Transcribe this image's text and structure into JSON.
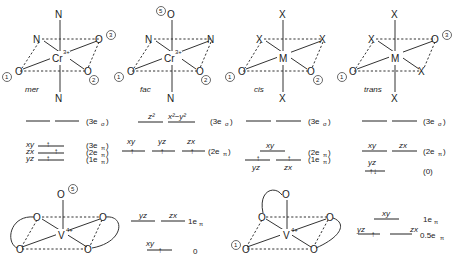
{
  "panels": {
    "mer": {
      "name": "mer",
      "metal": "Cr",
      "charge": "3+",
      "atoms": {
        "top": "N",
        "bottom": "N",
        "back_left": "N",
        "back_right": "O",
        "front_left": "O",
        "front_right": "O"
      },
      "markers": {
        "back_right": "3",
        "front_left": "1",
        "front_right": "2"
      },
      "levels": {
        "upper": {
          "label": "(3e",
          "sub": "σ",
          "close": ")"
        },
        "lower": [
          {
            "orbital": "xy",
            "label": "(3e",
            "sub": "π",
            "close": ")",
            "electrons": "↑"
          },
          {
            "orbital": "zx",
            "label": "(2e",
            "sub": "π",
            "close": ")",
            "electrons": "↑"
          },
          {
            "orbital": "yz",
            "label": "(1e",
            "sub": "π",
            "close": ")",
            "electrons": "↑"
          }
        ]
      }
    },
    "fac": {
      "name": "fac",
      "metal": "Cr",
      "charge": "3+",
      "atoms": {
        "top": "O",
        "bottom": "N",
        "back_left": "N",
        "back_right": "N",
        "front_left": "O",
        "front_right": "O"
      },
      "markers": {
        "top": "5",
        "front_left": "1",
        "front_right": "2"
      },
      "levels": {
        "upper": {
          "orbitals": [
            "z²",
            "x²−y²"
          ],
          "label": "(3e",
          "sub": "σ",
          "close": ")"
        },
        "lower": {
          "orbitals": [
            "xy",
            "yz",
            "zx"
          ],
          "electrons": [
            "↑",
            "↑",
            "↑"
          ],
          "label": "(2e",
          "sub": "π",
          "close": ")"
        }
      }
    },
    "cis": {
      "name": "cis",
      "metal": "M",
      "atoms": {
        "top": "X",
        "bottom": "X",
        "back_left": "X",
        "back_right": "X",
        "front_left": "O",
        "front_right": "O"
      },
      "markers": {
        "front_left": "1",
        "front_right": "2"
      },
      "levels": {
        "upper": {
          "label": "(3e",
          "sub": "σ",
          "close": ")"
        },
        "lower": {
          "orbitals": [
            "xy",
            "yz",
            "zx"
          ],
          "electrons": [
            "",
            "↑",
            "↑"
          ],
          "labels": [
            {
              "label": "(2e",
              "sub": "π",
              "close": ")"
            },
            {
              "label": "(1e",
              "sub": "π",
              "close": ")"
            }
          ]
        }
      }
    },
    "trans": {
      "name": "trans",
      "metal": "M",
      "atoms": {
        "top": "X",
        "bottom": "X",
        "back_left": "X",
        "back_right": "O",
        "front_left": "O",
        "front_right": "X"
      },
      "markers": {
        "back_right": "3",
        "front_left": "1"
      },
      "levels": {
        "upper": {
          "label": "(3e",
          "sub": "σ",
          "close": ")"
        },
        "middle": {
          "orbitals": [
            "xy",
            "zx"
          ],
          "label": "(2e",
          "sub": "π",
          "close": ")"
        },
        "lower": {
          "orbital": "yz",
          "electrons": "↑↓",
          "label": "(0)"
        }
      }
    },
    "vanadyl_1": {
      "metal": "V",
      "charge": "4+",
      "atoms": {
        "top": "O",
        "back_left": "O",
        "back_right": "O",
        "front_left": "O",
        "front_right": "O"
      },
      "markers": {
        "top": "5"
      },
      "levels": {
        "upper": {
          "orbitals": [
            "yz",
            "zx"
          ],
          "label": "1e",
          "sub": "π"
        },
        "lower": {
          "orbital": "xy",
          "electrons": "↑",
          "label": "0"
        }
      }
    },
    "vanadyl_2": {
      "metal": "V",
      "charge": "4+",
      "atoms": {
        "top": "O",
        "back_left": "O",
        "back_right": "O",
        "front_left": "O",
        "front_right": "O"
      },
      "markers": {
        "front_left": "1"
      },
      "levels": {
        "upper": {
          "orbital": "xy",
          "label": "1e",
          "sub": "π"
        },
        "lower": {
          "orbitals": [
            "yz",
            "zx"
          ],
          "electrons": [
            "↑",
            ""
          ],
          "label": "0.5e",
          "sub": "π"
        }
      }
    }
  }
}
